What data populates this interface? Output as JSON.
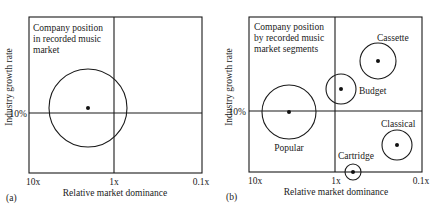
{
  "panels": [
    {
      "id": "a",
      "panel_label": "(a)",
      "title_lines": [
        "Company position",
        "in recorded music",
        "market"
      ],
      "y_axis_label": "Industry growth rate",
      "y_tick": "10%",
      "x_axis_label": "Relative market dominance",
      "x_ticks": [
        "10x",
        "1x",
        "0.1x"
      ],
      "bubbles": [
        {
          "name": "Recorded music market",
          "label": "",
          "cx": 88,
          "cy": 108,
          "r": 39
        }
      ]
    },
    {
      "id": "b",
      "panel_label": "(b)",
      "title_lines": [
        "Company position",
        "by recorded music",
        "market segments"
      ],
      "y_axis_label": "Industry growth rate",
      "y_tick": "10%",
      "x_axis_label": "Relative market dominance",
      "x_ticks": [
        "10x",
        "1x",
        "0.1x"
      ],
      "bubbles": [
        {
          "name": "Popular",
          "label": "Popular",
          "cx": 289,
          "cy": 112,
          "r": 27
        },
        {
          "name": "Budget",
          "label": "Budget",
          "cx": 341,
          "cy": 89,
          "r": 15
        },
        {
          "name": "Cassette",
          "label": "Cassette",
          "cx": 378,
          "cy": 61,
          "r": 18
        },
        {
          "name": "Classical",
          "label": "Classical",
          "cx": 397,
          "cy": 145,
          "r": 15
        },
        {
          "name": "Cartridge",
          "label": "Cartridge",
          "cx": 353,
          "cy": 172,
          "r": 8
        }
      ]
    }
  ]
}
